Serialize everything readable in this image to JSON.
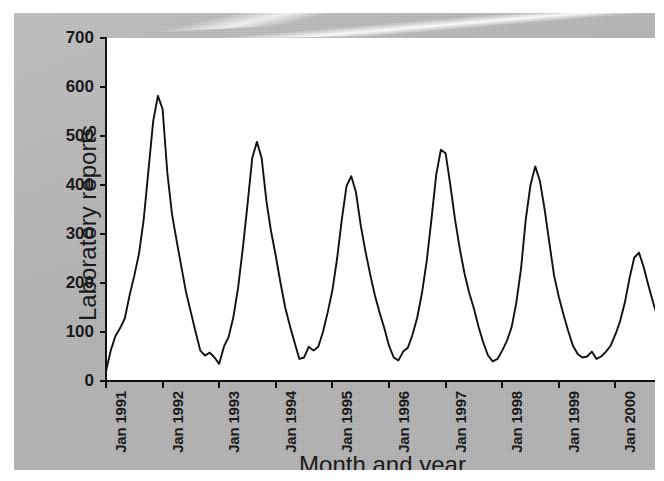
{
  "figure": {
    "background_color": "#ffffff",
    "panel_color": "#b3b3b3",
    "plot_background": "#ffffff",
    "line_color": "#111111"
  },
  "chart_data": {
    "type": "line",
    "title": "",
    "xlabel": "Month and year",
    "ylabel": "Laboratory reports",
    "ylim": [
      0,
      700
    ],
    "yticks": [
      0,
      100,
      200,
      300,
      400,
      500,
      600,
      700
    ],
    "ytick_labels": [
      "0",
      "100",
      "200",
      "300",
      "400",
      "500",
      "600",
      "700"
    ],
    "xtick_labels": [
      "Jan 1991",
      "Jan 1992",
      "Jan 1993",
      "Jan 1994",
      "Jan 1995",
      "Jan 1996",
      "Jan 1997",
      "Jan 1998",
      "Jan 1999",
      "Jan 2000"
    ],
    "xtick_index": [
      0,
      12,
      24,
      36,
      48,
      60,
      72,
      84,
      96,
      108
    ],
    "grid": false,
    "legend": null,
    "x_start": "Jan 1991",
    "x_end": "Jul 2000",
    "n_points": 115,
    "series": [
      {
        "name": "Laboratory reports",
        "values": [
          20,
          62,
          92,
          108,
          128,
          175,
          215,
          260,
          330,
          430,
          530,
          582,
          555,
          425,
          340,
          285,
          232,
          180,
          140,
          100,
          62,
          52,
          58,
          48,
          35,
          70,
          90,
          130,
          190,
          270,
          360,
          455,
          488,
          455,
          368,
          305,
          255,
          200,
          150,
          112,
          78,
          45,
          48,
          70,
          62,
          70,
          100,
          140,
          185,
          250,
          330,
          398,
          418,
          385,
          318,
          265,
          218,
          175,
          140,
          108,
          72,
          48,
          42,
          60,
          68,
          95,
          130,
          180,
          245,
          330,
          420,
          472,
          465,
          400,
          330,
          270,
          220,
          180,
          148,
          110,
          78,
          52,
          40,
          45,
          62,
          82,
          110,
          160,
          230,
          330,
          400,
          438,
          408,
          350,
          282,
          215,
          172,
          135,
          102,
          72,
          55,
          48,
          50,
          60,
          45,
          50,
          60,
          72,
          95,
          122,
          160,
          210,
          252,
          262,
          232,
          195,
          160,
          128,
          100,
          78,
          62,
          50,
          42,
          40,
          60,
          100,
          128,
          98,
          75,
          88,
          118,
          112,
          92,
          75,
          60,
          45,
          30,
          18,
          10,
          6,
          5,
          12,
          25,
          48,
          80,
          128,
          182,
          232,
          282,
          305,
          288,
          252,
          212,
          175,
          142,
          112,
          88,
          62,
          40,
          22,
          12,
          10,
          18,
          38,
          72,
          128,
          192,
          258,
          305,
          328,
          300,
          252,
          205,
          168,
          138,
          112,
          90,
          72,
          55,
          40,
          30,
          22,
          15,
          12,
          20,
          45,
          95,
          165,
          245,
          330,
          428,
          490,
          440,
          350,
          268,
          238,
          268,
          232,
          190,
          152,
          122,
          98,
          80,
          62,
          45,
          32,
          20,
          14,
          12,
          18,
          38,
          78,
          140,
          215,
          300,
          395,
          462,
          420,
          345,
          272,
          208,
          160,
          128,
          102
        ]
      }
    ]
  },
  "axes": {
    "y_title": "Laboratory reports",
    "x_title": "Month and year"
  }
}
